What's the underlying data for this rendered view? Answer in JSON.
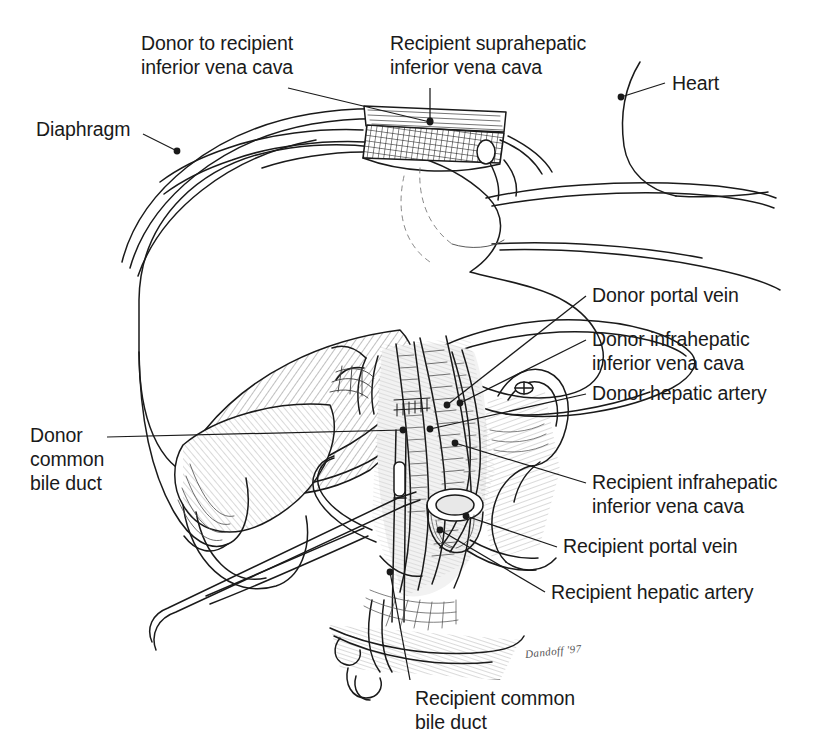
{
  "figure": {
    "kind": "medical-illustration",
    "width": 816,
    "height": 744,
    "background_color": "#ffffff",
    "ink_color": "#1a1a1a",
    "signature": "Dandoff '97"
  },
  "labels": [
    {
      "id": "donor-to-recipient-ivc",
      "lines": [
        "Donor to recipient",
        "inferior vena cava"
      ],
      "x": 141,
      "y": 31,
      "leader": {
        "from": [
          288,
          88
        ],
        "to": [
          430,
          122
        ],
        "dot": [
          430,
          122
        ]
      }
    },
    {
      "id": "recipient-suprahepatic-ivc",
      "lines": [
        "Recipient suprahepatic",
        "inferior vena cava"
      ],
      "x": 390,
      "y": 31,
      "leader": {
        "from": [
          430,
          88
        ],
        "to": [
          430,
          121
        ],
        "dot": [
          430,
          121
        ]
      }
    },
    {
      "id": "heart",
      "lines": [
        "Heart"
      ],
      "x": 672,
      "y": 71,
      "leader": {
        "from": [
          665,
          83
        ],
        "to": [
          621,
          97
        ],
        "dot": [
          621,
          97
        ]
      }
    },
    {
      "id": "diaphragm",
      "lines": [
        "Diaphragm"
      ],
      "x": 36,
      "y": 117,
      "leader": {
        "from": [
          143,
          134
        ],
        "to": [
          177,
          151
        ],
        "dot": [
          177,
          151
        ]
      }
    },
    {
      "id": "donor-portal-vein",
      "lines": [
        "Donor portal vein"
      ],
      "x": 592,
      "y": 283,
      "leader": {
        "from": [
          586,
          296
        ],
        "to": [
          447,
          405
        ],
        "dot": [
          447,
          405
        ]
      }
    },
    {
      "id": "donor-infrahepatic-ivc",
      "lines": [
        "Donor infrahepatic",
        "inferior vena cava"
      ],
      "x": 592,
      "y": 327,
      "leader": {
        "from": [
          586,
          340
        ],
        "to": [
          460,
          403
        ],
        "dot": [
          460,
          403
        ]
      }
    },
    {
      "id": "donor-hepatic-artery",
      "lines": [
        "Donor hepatic artery"
      ],
      "x": 592,
      "y": 381,
      "leader": {
        "from": [
          586,
          394
        ],
        "to": [
          430,
          429
        ],
        "dot": [
          430,
          429
        ]
      }
    },
    {
      "id": "donor-common-bile-duct",
      "lines": [
        "Donor",
        "common",
        "bile duct"
      ],
      "x": 30,
      "y": 423,
      "leader": {
        "from": [
          107,
          437
        ],
        "to": [
          403,
          430
        ],
        "dot": [
          403,
          430
        ]
      }
    },
    {
      "id": "recipient-infrahepatic-ivc",
      "lines": [
        "Recipient infrahepatic",
        "inferior vena cava"
      ],
      "x": 592,
      "y": 470,
      "leader": {
        "from": [
          586,
          483
        ],
        "to": [
          455,
          443
        ],
        "dot": [
          455,
          443
        ]
      }
    },
    {
      "id": "recipient-portal-vein",
      "lines": [
        "Recipient portal vein"
      ],
      "x": 563,
      "y": 534,
      "leader": {
        "from": [
          557,
          547
        ],
        "to": [
          466,
          516
        ],
        "dot": [
          466,
          516
        ]
      }
    },
    {
      "id": "recipient-hepatic-artery",
      "lines": [
        "Recipient hepatic artery"
      ],
      "x": 551,
      "y": 580,
      "leader": {
        "from": [
          545,
          592
        ],
        "to": [
          440,
          530
        ],
        "dot": [
          440,
          530
        ]
      }
    },
    {
      "id": "recipient-common-bile-duct",
      "lines": [
        "Recipient common",
        "bile duct"
      ],
      "x": 415,
      "y": 686,
      "leader": {
        "from": [
          410,
          680
        ],
        "to": [
          390,
          572
        ],
        "dot": [
          390,
          572
        ]
      }
    }
  ]
}
